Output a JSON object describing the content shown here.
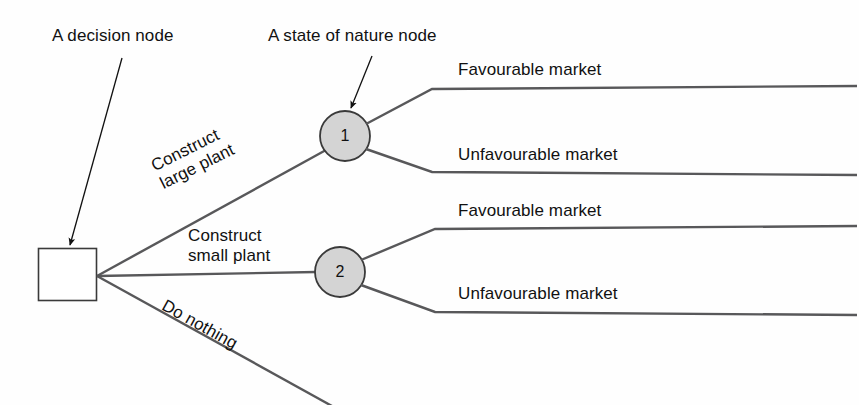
{
  "diagram": {
    "type": "decision-tree",
    "background_color": "#fefefe",
    "line_color": "#58585a",
    "node_fill": "#d4d4d4",
    "node_stroke": "#3a3a3a",
    "text_color": "#111111"
  },
  "annotations": [
    {
      "id": "decision-node-annotation",
      "text": "A decision node",
      "x": 52,
      "y": 26,
      "arrow": {
        "x1": 122,
        "y1": 58,
        "x2": 70,
        "y2": 245
      }
    },
    {
      "id": "state-of-nature-annotation",
      "text": "A state of nature node",
      "x": 268,
      "y": 26,
      "arrow": {
        "x1": 372,
        "y1": 56,
        "x2": 351,
        "y2": 108
      }
    }
  ],
  "decision_node": {
    "label": "",
    "shape": "square",
    "x": 38,
    "y": 248,
    "width": 58,
    "height": 52
  },
  "state_nodes": [
    {
      "id": "node-1",
      "label": "1",
      "shape": "circle",
      "cx": 345,
      "cy": 136,
      "r": 25
    },
    {
      "id": "node-2",
      "label": "2",
      "shape": "circle",
      "cx": 340,
      "cy": 272,
      "r": 25
    }
  ],
  "decision_branches": [
    {
      "id": "construct-large-plant",
      "label": "Construct\nlarge plant",
      "label_x": 148,
      "label_y": 158,
      "rotated": true,
      "angle_deg": -26.5
    },
    {
      "id": "construct-small-plant",
      "label": "Construct\nsmall plant",
      "label_x": 188,
      "label_y": 226,
      "rotated": false,
      "angle_deg": 0
    },
    {
      "id": "do-nothing",
      "label": "Do nothing",
      "label_x": 168,
      "label_y": 296,
      "rotated": true,
      "angle_deg": 29
    }
  ],
  "outcome_branches": [
    {
      "id": "node1-favourable",
      "parent": "node-1",
      "label": "Favourable market",
      "label_x": 458,
      "label_y": 60,
      "line_y": 88
    },
    {
      "id": "node1-unfavourable",
      "parent": "node-1",
      "label": "Unfavourable market",
      "label_x": 458,
      "label_y": 145,
      "line_y": 172
    },
    {
      "id": "node2-favourable",
      "parent": "node-2",
      "label": "Favourable market",
      "label_x": 458,
      "label_y": 201,
      "line_y": 229
    },
    {
      "id": "node2-unfavourable",
      "parent": "node-2",
      "label": "Unfavourable market",
      "label_x": 458,
      "label_y": 284,
      "line_y": 312
    }
  ]
}
